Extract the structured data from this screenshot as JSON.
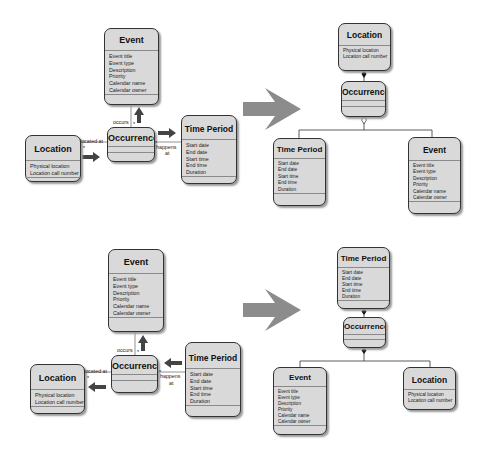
{
  "diagrams": {
    "top_left": {
      "event": {
        "title": "Event",
        "attrs": [
          "Event title",
          "Event type",
          "Description",
          "Priority",
          "Calendar name",
          "Calendar owner"
        ]
      },
      "location": {
        "title": "Location",
        "attrs": [
          "Physical location",
          "Location call number"
        ]
      },
      "occurrence": {
        "title": "Occurrence"
      },
      "time_period": {
        "title": "Time Period",
        "attrs": [
          "Start date",
          "End date",
          "Start time",
          "End time",
          "Duration"
        ]
      },
      "labels": {
        "occurs": "occurs",
        "located_at": "located at",
        "happens": "happens",
        "at": "at",
        "mult": "*"
      }
    },
    "top_right": {
      "location": {
        "title": "Location",
        "attrs": [
          "Physical location",
          "Location call number"
        ]
      },
      "occurrence": {
        "title": "Occurrence"
      },
      "time_period": {
        "title": "Time Period",
        "attrs": [
          "Start date",
          "End date",
          "Start time",
          "End time",
          "Duration"
        ]
      },
      "event": {
        "title": "Event",
        "attrs": [
          "Event title",
          "Event type",
          "Description",
          "Priority",
          "Calendar name",
          "Calendar owner"
        ]
      }
    },
    "bottom_left": {
      "event": {
        "title": "Event",
        "attrs": [
          "Event title",
          "Event type",
          "Description",
          "Priority",
          "Calendar name",
          "Calendar owner"
        ]
      },
      "location": {
        "title": "Location",
        "attrs": [
          "Physical location",
          "Location call number"
        ]
      },
      "occurrence": {
        "title": "Occurrence"
      },
      "time_period": {
        "title": "Time Period",
        "attrs": [
          "Start date",
          "End date",
          "Start time",
          "End time",
          "Duration"
        ]
      },
      "labels": {
        "occurs": "occurs",
        "located_at": "located at",
        "happens": "happens",
        "at": "at",
        "mult": "*"
      }
    },
    "bottom_right": {
      "time_period": {
        "title": "Time Period",
        "attrs": [
          "Start date",
          "End date",
          "Start time",
          "End time",
          "Duration"
        ]
      },
      "occurrence": {
        "title": "Occurrence"
      },
      "event": {
        "title": "Event",
        "attrs": [
          "Event title",
          "Event type",
          "Description",
          "Priority",
          "Calendar name",
          "Calendar owner"
        ]
      },
      "location": {
        "title": "Location",
        "attrs": [
          "Physical location",
          "Location call number"
        ]
      }
    }
  },
  "colors": {
    "box_fill": "#d9d9d9",
    "box_border": "#333333",
    "transform_arrow": "#8c8c8c",
    "nav_arrow": "#444444"
  }
}
